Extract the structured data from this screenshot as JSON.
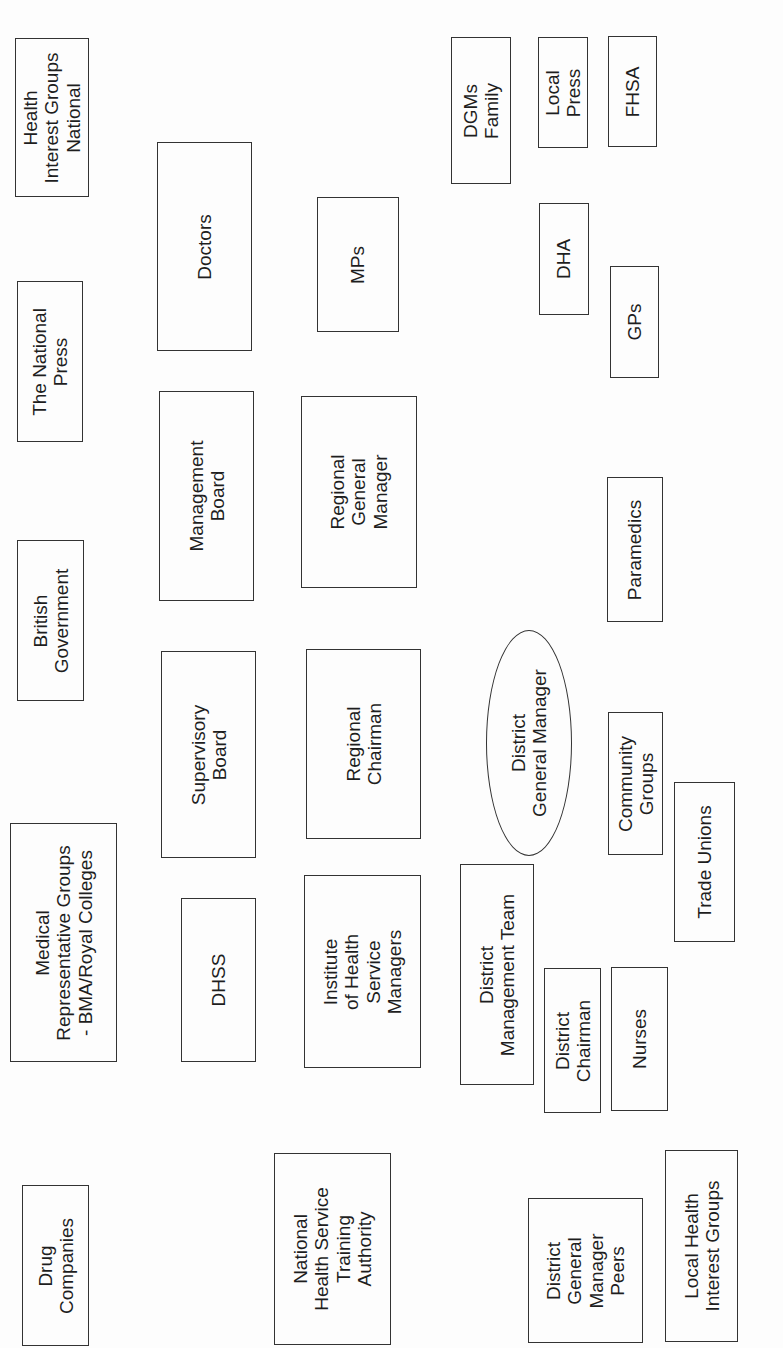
{
  "diagram": {
    "type": "stakeholder-map",
    "orientation": "rotated-90-ccw",
    "central_node": "District General Manager",
    "nodes": [
      {
        "id": "health-interest-groups-national",
        "label": "Health\nInterest Groups\nNational",
        "shape": "rect",
        "box": [
          15,
          38,
          74,
          159
        ]
      },
      {
        "id": "the-national-press",
        "label": "The National\nPress",
        "shape": "rect",
        "box": [
          17,
          281,
          66,
          161
        ]
      },
      {
        "id": "british-government",
        "label": "British\nGovernment",
        "shape": "rect",
        "box": [
          17,
          540,
          67,
          161
        ]
      },
      {
        "id": "medical-representative-groups",
        "label": "Medical\nRepresentative Groups\n- BMA/Royal Colleges",
        "shape": "rect",
        "box": [
          10,
          823,
          107,
          239
        ]
      },
      {
        "id": "drug-companies",
        "label": "Drug\nCompanies",
        "shape": "rect",
        "box": [
          22,
          1185,
          67,
          161
        ]
      },
      {
        "id": "doctors",
        "label": "Doctors",
        "shape": "rect",
        "box": [
          157,
          142,
          95,
          209
        ]
      },
      {
        "id": "management-board",
        "label": "Management\nBoard",
        "shape": "rect",
        "box": [
          159,
          391,
          95,
          210
        ]
      },
      {
        "id": "supervisory-board",
        "label": "Supervisory\nBoard",
        "shape": "rect",
        "box": [
          161,
          651,
          95,
          207
        ]
      },
      {
        "id": "dhss",
        "label": "DHSS",
        "shape": "rect",
        "box": [
          181,
          898,
          75,
          164
        ]
      },
      {
        "id": "nhs-training-authority",
        "label": "National\nHealth Service\nTraining\nAuthority",
        "shape": "rect",
        "box": [
          274,
          1153,
          117,
          192
        ]
      },
      {
        "id": "mps",
        "label": "MPs",
        "shape": "rect",
        "box": [
          317,
          197,
          82,
          135
        ]
      },
      {
        "id": "regional-general-manager",
        "label": "Regional\nGeneral\nManager",
        "shape": "rect",
        "box": [
          301,
          396,
          116,
          192
        ]
      },
      {
        "id": "regional-chairman",
        "label": "Regional\nChairman",
        "shape": "rect",
        "box": [
          306,
          649,
          115,
          190
        ]
      },
      {
        "id": "institute-health-service-managers",
        "label": "Institute\nof Health\nService\nManagers",
        "shape": "rect",
        "box": [
          304,
          875,
          117,
          193
        ]
      },
      {
        "id": "dgms-family",
        "label": "DGMs\nFamily",
        "shape": "rect",
        "box": [
          451,
          37,
          60,
          147
        ]
      },
      {
        "id": "local-press",
        "label": "Local\nPress",
        "shape": "rect",
        "box": [
          538,
          37,
          50,
          111
        ]
      },
      {
        "id": "fhsa",
        "label": "FHSA",
        "shape": "rect",
        "box": [
          608,
          36,
          49,
          111
        ]
      },
      {
        "id": "dha",
        "label": "DHA",
        "shape": "rect",
        "box": [
          539,
          203,
          50,
          112
        ]
      },
      {
        "id": "gps",
        "label": "GPs",
        "shape": "rect",
        "box": [
          610,
          266,
          49,
          112
        ]
      },
      {
        "id": "paramedics",
        "label": "Paramedics",
        "shape": "rect",
        "box": [
          607,
          477,
          56,
          145
        ]
      },
      {
        "id": "district-general-manager",
        "label": "District\nGeneral Manager",
        "shape": "ellipse",
        "box": [
          486,
          630,
          86,
          226
        ]
      },
      {
        "id": "community-groups",
        "label": "Community\nGroups",
        "shape": "rect",
        "box": [
          608,
          712,
          55,
          143
        ]
      },
      {
        "id": "trade-unions",
        "label": "Trade Unions",
        "shape": "rect",
        "box": [
          674,
          782,
          61,
          160
        ]
      },
      {
        "id": "district-management-team",
        "label": "District\nManagement Team",
        "shape": "rect",
        "box": [
          460,
          864,
          74,
          221
        ]
      },
      {
        "id": "district-chairman",
        "label": "District\nChairman",
        "shape": "rect",
        "box": [
          544,
          968,
          57,
          145
        ]
      },
      {
        "id": "nurses",
        "label": "Nurses",
        "shape": "rect",
        "box": [
          611,
          967,
          57,
          144
        ]
      },
      {
        "id": "district-general-manager-peers",
        "label": "District\nGeneral\nManager\nPeers",
        "shape": "rect",
        "box": [
          528,
          1198,
          115,
          145
        ]
      },
      {
        "id": "local-health-interest-groups",
        "label": "Local Health\nInterest Groups",
        "shape": "rect",
        "box": [
          665,
          1150,
          73,
          192
        ]
      }
    ]
  }
}
